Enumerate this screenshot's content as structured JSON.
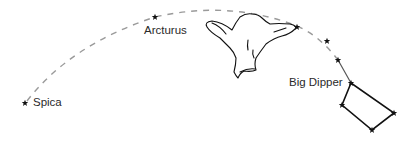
{
  "diagram": {
    "labels": {
      "spica": "Spica",
      "arcturus": "Arcturus",
      "big_dipper": "Big Dipper"
    },
    "colors": {
      "arc": "#9a9a9a",
      "lines": "#111111",
      "handle_line": "#555555",
      "text": "#2a2a2a"
    }
  }
}
